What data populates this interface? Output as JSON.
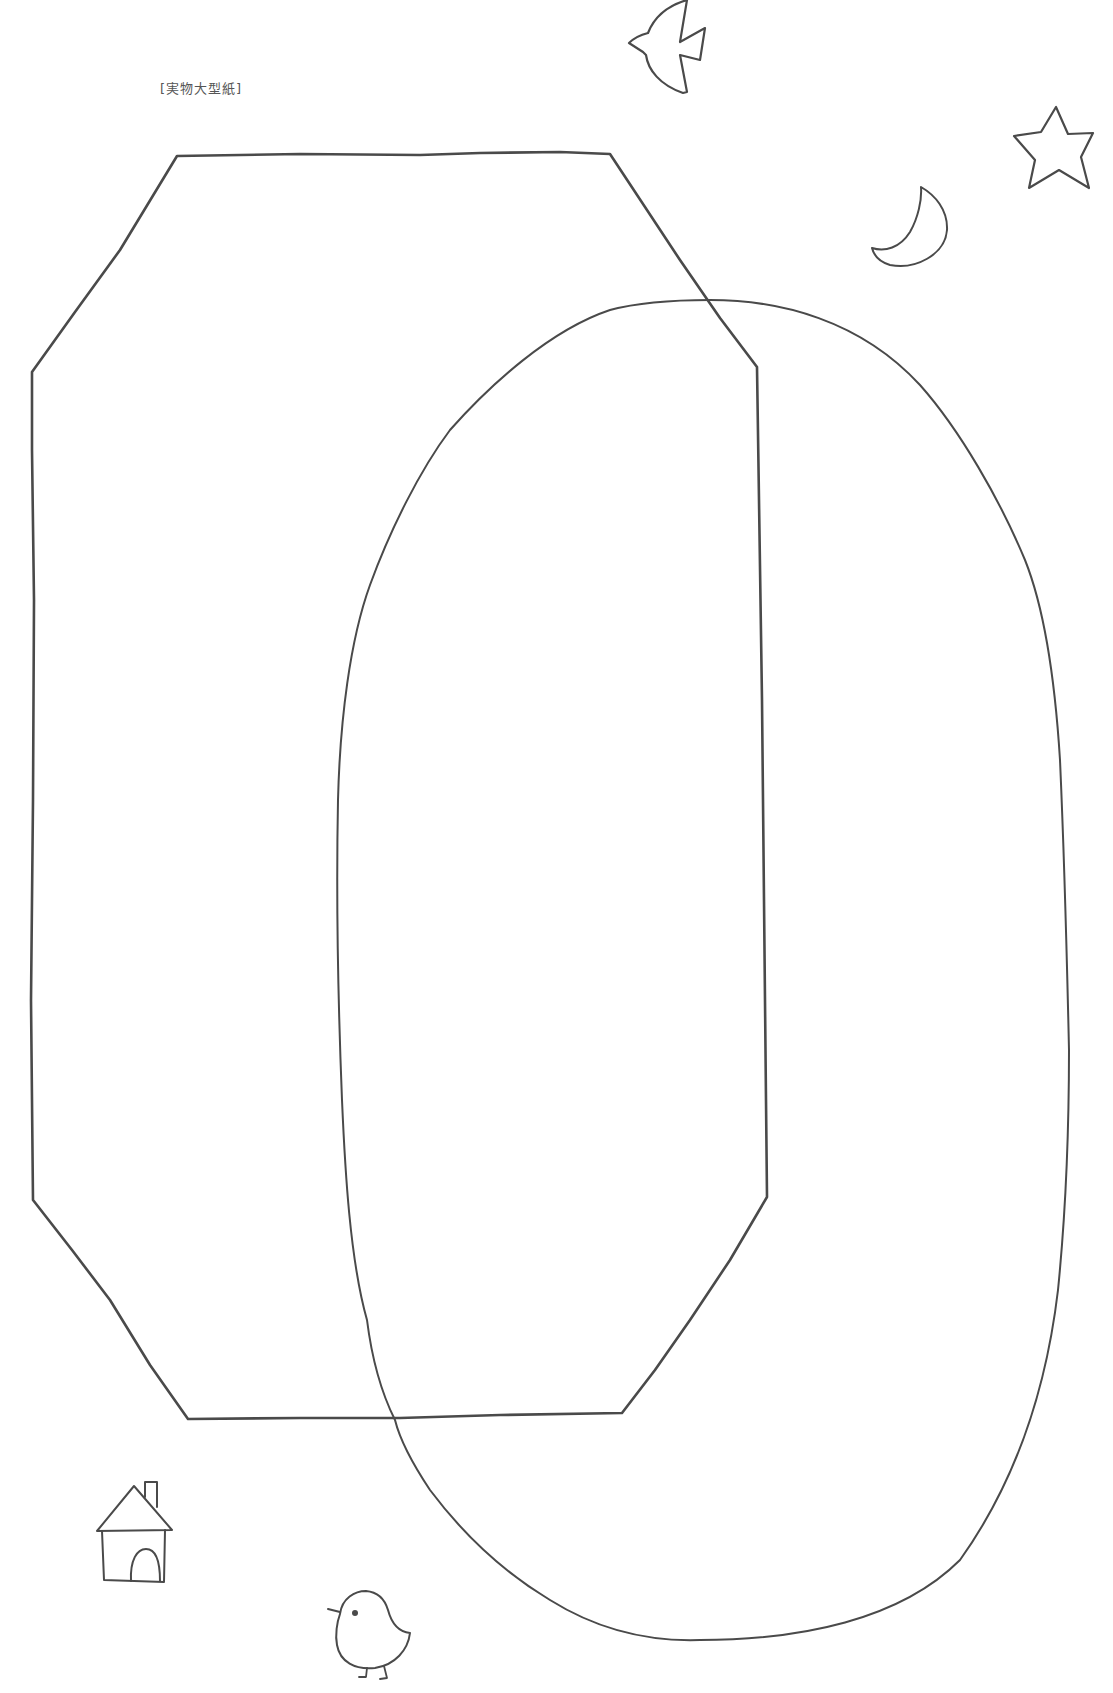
{
  "page": {
    "label": "[実物大型紙]",
    "background_color": "#ffffff",
    "line_color": "#4a4a4a",
    "label_color": "#555555"
  },
  "pattern_pieces": [
    {
      "name": "octagon-piece",
      "shape": "octagon",
      "stroke_width": 2.6
    },
    {
      "name": "oval-piece",
      "shape": "oval",
      "stroke_width": 2
    }
  ],
  "decorations": [
    {
      "name": "bird",
      "icon": "bird-icon"
    },
    {
      "name": "star",
      "icon": "star-icon"
    },
    {
      "name": "crescent-moon",
      "icon": "moon-icon"
    },
    {
      "name": "house",
      "icon": "house-icon"
    },
    {
      "name": "chick",
      "icon": "chick-icon"
    }
  ]
}
